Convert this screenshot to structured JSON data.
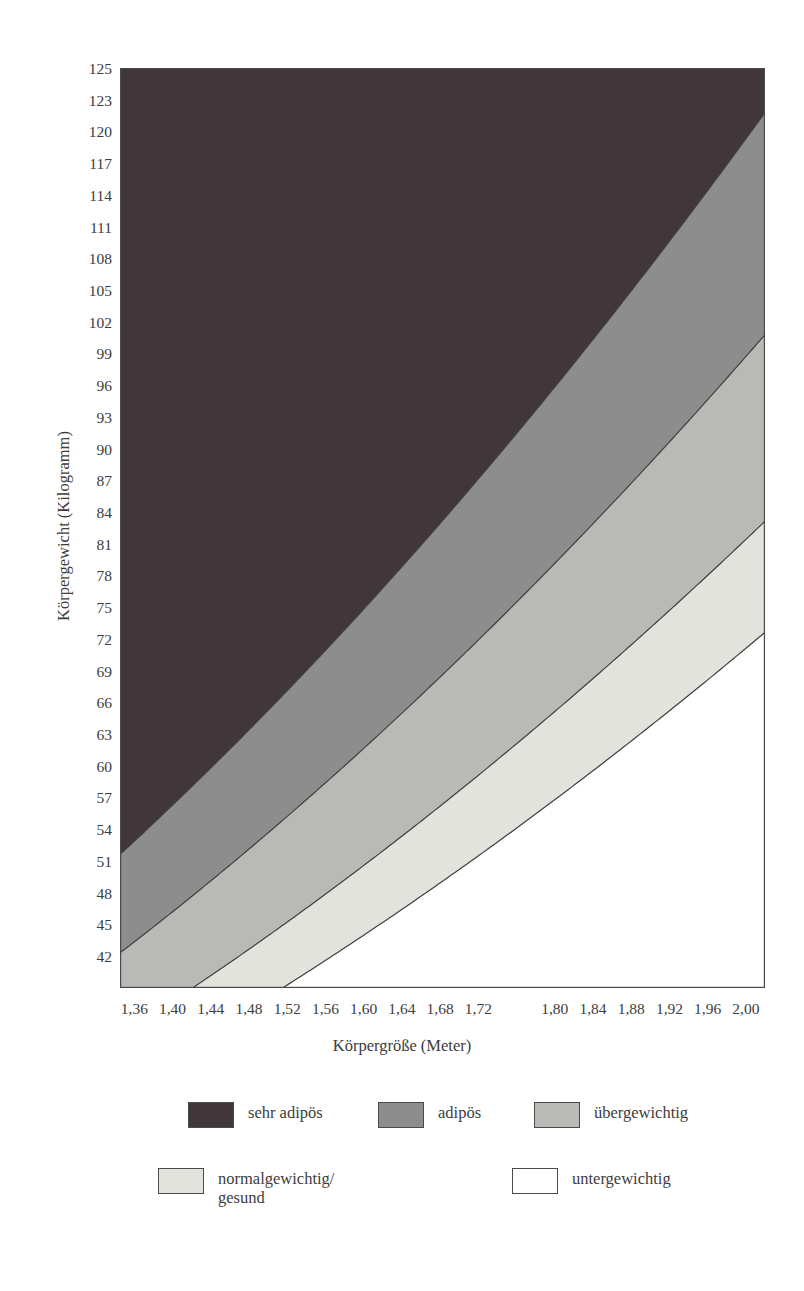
{
  "chart_data": {
    "type": "area",
    "title": "",
    "xlabel": "Körpergröße (Meter)",
    "ylabel": "Körpergewicht (Kilogramm)",
    "xlim": [
      1.345,
      2.02
    ],
    "ylim": [
      42,
      126.5
    ],
    "grid": false,
    "legend_position": "below",
    "x_tick_labels": [
      "1,36",
      "1,40",
      "1,44",
      "1,48",
      "1,52",
      "1,56",
      "1,60",
      "1,64",
      "1,68",
      "1,72",
      "1,80",
      "1,84",
      "1,88",
      "1,92",
      "1,96",
      "2,00"
    ],
    "x_tick_values": [
      1.36,
      1.4,
      1.44,
      1.48,
      1.52,
      1.56,
      1.6,
      1.64,
      1.68,
      1.72,
      1.8,
      1.84,
      1.88,
      1.92,
      1.96,
      2.0
    ],
    "y_tick_labels": [
      "125",
      "123",
      "120",
      "117",
      "114",
      "111",
      "108",
      "105",
      "102",
      "99",
      "96",
      "93",
      "90",
      "87",
      "84",
      "81",
      "78",
      "75",
      "72",
      "69",
      "66",
      "63",
      "60",
      "57",
      "54",
      "51",
      "48",
      "45",
      "42"
    ],
    "y_tick_values": [
      125,
      123,
      120,
      117,
      114,
      111,
      108,
      105,
      102,
      99,
      96,
      93,
      90,
      87,
      84,
      81,
      78,
      75,
      72,
      69,
      66,
      63,
      60,
      57,
      57,
      51,
      48,
      45,
      42
    ],
    "bands": [
      {
        "name": "sehr adipös",
        "bmi_min": 30.0,
        "bmi_max": null,
        "color": "#413639"
      },
      {
        "name": "adipös",
        "bmi_min": 25.0,
        "bmi_max": 30.0,
        "color": "#8d8d8d"
      },
      {
        "name": "übergewichtig",
        "bmi_min": 20.8,
        "bmi_max": 25.0,
        "color": "#b9b9b6"
      },
      {
        "name": "normalgewichtig/gesund",
        "bmi_min": 18.3,
        "bmi_max": 20.8,
        "color": "#e3e3dd"
      },
      {
        "name": "untergewichtig",
        "bmi_min": null,
        "bmi_max": 18.3,
        "color": "#ffffff"
      }
    ],
    "boundary_curves": [
      {
        "label": "BMI 30",
        "bmi": 30.0
      },
      {
        "label": "BMI 25",
        "bmi": 25.0
      },
      {
        "label": "BMI 20.8",
        "bmi": 20.8
      },
      {
        "label": "BMI 18.3",
        "bmi": 18.3
      }
    ],
    "axis_color": "#4a4a4a",
    "outline_color": "#3f3f3f"
  },
  "axes": {
    "y_title": "Körpergewicht (Kilogramm)",
    "x_title": "Körpergröße (Meter)"
  },
  "legend": {
    "items": [
      {
        "label": "sehr adipös",
        "color": "#413639"
      },
      {
        "label": "adipös",
        "color": "#8d8d8d"
      },
      {
        "label": "übergewichtig",
        "color": "#b9b9b6"
      },
      {
        "label": "normalgewichtig/\ngesund",
        "color": "#e3e3dd"
      },
      {
        "label": "untergewichtig",
        "color": "#ffffff"
      }
    ]
  }
}
